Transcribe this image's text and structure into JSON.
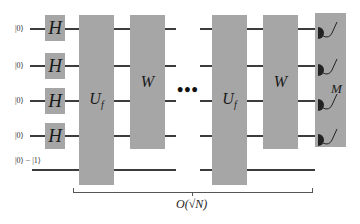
{
  "diagram": {
    "type": "quantum-circuit",
    "inputs": [
      "|0⟩",
      "|0⟩",
      "|0⟩",
      "|0⟩",
      "|0⟩ − |1⟩"
    ],
    "hadamard_label": "H",
    "oracle_label": "U",
    "oracle_subscript": "f",
    "diffusion_label": "W",
    "measure_label": "M",
    "ellipsis": "•••",
    "repetition_label": "O(√N)",
    "colors": {
      "gate_fill": "#a6a6a6",
      "wire": "#3c3c3c",
      "meter": "#222222"
    }
  }
}
